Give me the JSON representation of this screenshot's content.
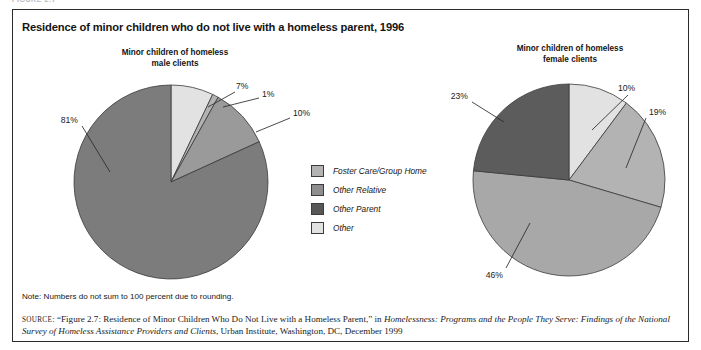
{
  "figure": {
    "number_label": "FIGURE 2.7",
    "title": "Residence of minor children who do not live with a homeless parent, 1996",
    "note": "Note: Numbers do not sum to 100 percent due to rounding.",
    "source": {
      "prefix": "SOURCE",
      "part1": ": “Figure 2.7: Residence of Minor Children Who Do Not Live with a Homeless Parent,” in ",
      "italic1": "Homelessness: Programs and the People They Serve: Findings of the National Survey of Homeless Assistance Providers and Clients",
      "part2": ", Urban Institute, Washington, DC, December 1999"
    }
  },
  "legend": {
    "items": [
      {
        "label": "Foster Care/Group Home",
        "color": "#b3b3b3"
      },
      {
        "label": "Other Relative",
        "color": "#8e8e8e"
      },
      {
        "label": "Other Parent",
        "color": "#575757"
      },
      {
        "label": "Other",
        "color": "#e2e2e2"
      }
    ]
  },
  "chart_data": [
    {
      "type": "pie",
      "title": "Minor children of homeless male clients",
      "title_lines": [
        "Minor children of homeless",
        "male clients"
      ],
      "categories": [
        "Other",
        "Foster Care/Group Home",
        "Other Relative",
        "Other Parent"
      ],
      "values": [
        7,
        1,
        10,
        81
      ],
      "labels": [
        "7%",
        "1%",
        "10%",
        "81%"
      ],
      "colors": [
        "#e2e2e2",
        "#b3b3b3",
        "#9a9a9a",
        "#7c7c7c"
      ],
      "start_angle": 0,
      "legend_position": "center"
    },
    {
      "type": "pie",
      "title": "Minor children of homeless female clients",
      "title_lines": [
        "Minor children of homeless",
        "female clients"
      ],
      "categories": [
        "Other",
        "Foster Care/Group Home",
        "Other Relative",
        "Other Parent"
      ],
      "values": [
        10,
        19,
        46,
        23
      ],
      "labels": [
        "10%",
        "19%",
        "46%",
        "23%"
      ],
      "colors": [
        "#e2e2e2",
        "#b3b3b3",
        "#a8a8a8",
        "#5c5c5c"
      ],
      "start_angle": 0,
      "legend_position": "center"
    }
  ]
}
